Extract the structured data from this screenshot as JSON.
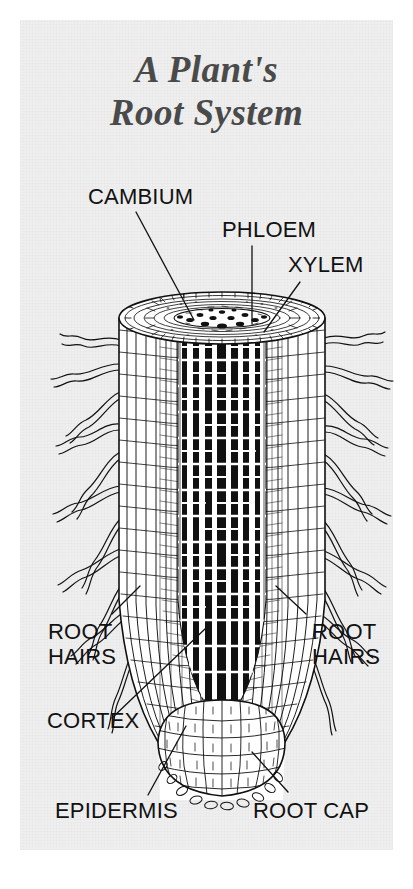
{
  "figure": {
    "name": "a-plants-root-system-diagram",
    "kind": "botanical-cutaway-illustration",
    "panel_background_color": "#efefef",
    "page_background_color": "#ffffff",
    "ink_color": "#111111",
    "title_color": "#4a4a4a"
  },
  "title": {
    "line1": "A Plant's",
    "line2": "Root System",
    "full": "A Plant's Root System"
  },
  "labels": {
    "cambium": "CAMBIUM",
    "phloem": "PHLOEM",
    "xylem": "XYLEM",
    "root_hairs_left_line1": "ROOT",
    "root_hairs_left_line2": "HAIRS",
    "root_hairs_right_line1": "ROOT",
    "root_hairs_right_line2": "HAIRS",
    "cortex": "CORTEX",
    "epidermis": "EPIDERMIS",
    "root_cap": "ROOT CAP"
  },
  "callouts": [
    {
      "id": "cambium",
      "label": "CAMBIUM",
      "side": "top-left",
      "leader": "diagonal-down-right"
    },
    {
      "id": "phloem",
      "label": "PHLOEM",
      "side": "top-center",
      "leader": "vertical-down"
    },
    {
      "id": "xylem",
      "label": "XYLEM",
      "side": "top-right",
      "leader": "diagonal-down-left"
    },
    {
      "id": "root-hairs-left",
      "label": "ROOT HAIRS",
      "side": "mid-left",
      "leader": "diagonal-up-right"
    },
    {
      "id": "root-hairs-right",
      "label": "ROOT HAIRS",
      "side": "mid-right",
      "leader": "diagonal-up-left"
    },
    {
      "id": "cortex",
      "label": "CORTEX",
      "side": "lower-left",
      "leader": "diagonal-up-right"
    },
    {
      "id": "epidermis",
      "label": "EPIDERMIS",
      "side": "bottom-left",
      "leader": "diagonal-up-right"
    },
    {
      "id": "root_cap",
      "label": "ROOT CAP",
      "side": "bottom-right",
      "leader": "diagonal-up-left"
    }
  ],
  "anatomy_parts": [
    "cambium",
    "phloem",
    "xylem",
    "root hairs",
    "cortex",
    "epidermis",
    "root cap"
  ]
}
